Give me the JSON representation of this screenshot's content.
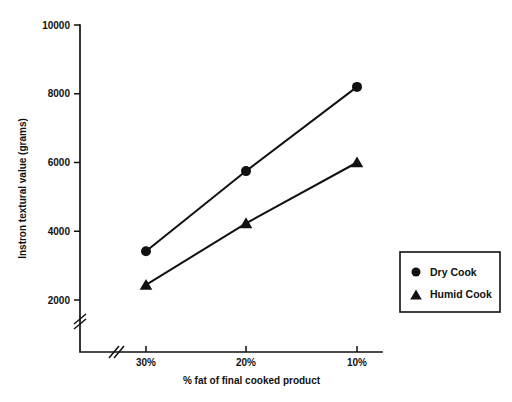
{
  "chart_data": {
    "type": "line",
    "title": "",
    "subtitle": "",
    "xlabel": "% fat of final cooked product",
    "ylabel": "Instron textural value (grams)",
    "categories": [
      "30%",
      "20%",
      "10%"
    ],
    "yticks": [
      2000,
      4000,
      6000,
      8000,
      10000
    ],
    "ytick_labels": [
      "2000",
      "4000",
      "6000",
      "8000",
      "10000"
    ],
    "ylim": [
      2000,
      10000
    ],
    "y_axis_break": true,
    "x_axis_break": true,
    "grid": false,
    "legend_position": "right-center",
    "series": [
      {
        "name": "Dry Cook",
        "marker": "circle",
        "values": [
          3420,
          5750,
          8200
        ]
      },
      {
        "name": "Humid Cook",
        "marker": "triangle",
        "values": [
          2440,
          4230,
          6000
        ]
      }
    ]
  },
  "legend": {
    "items": [
      {
        "label": "Dry Cook",
        "marker": "circle-marker"
      },
      {
        "label": "Humid Cook",
        "marker": "triangle-marker"
      }
    ]
  },
  "colors": {
    "ink": "#111111",
    "background": "#ffffff"
  }
}
